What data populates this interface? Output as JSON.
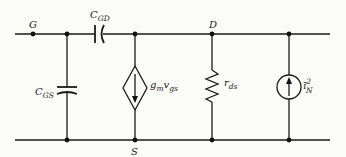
{
  "diagram": {
    "type": "MOSFET small-signal noise equivalent circuit",
    "nodes": {
      "gate": "G",
      "drain": "D",
      "source": "S"
    },
    "components": {
      "c_gd": {
        "symbol": "C",
        "subscript": "GD"
      },
      "c_gs": {
        "symbol": "C",
        "subscript": "GS"
      },
      "gm_source": {
        "main": "g",
        "sub1": "m",
        "main2": "v",
        "sub2": "gs"
      },
      "r_ds": {
        "symbol": "r",
        "subscript": "ds"
      },
      "noise_source": {
        "symbol": "ī",
        "superscript": "2",
        "subscript": "N"
      }
    },
    "colors": {
      "line": "#1a1a1a",
      "background": "#fbfbf7"
    }
  }
}
